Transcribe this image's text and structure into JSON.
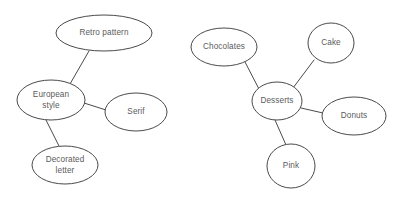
{
  "diagram": {
    "type": "node-link-graph",
    "background_color": "#ffffff",
    "stroke_color": "#4a4a4a",
    "text_color": "#5b5b5b",
    "clusters": [
      {
        "id": "european-style-cluster",
        "root": "European style",
        "nodes": [
          {
            "id": "retro-pattern",
            "label": "Retro pattern",
            "lines": [
              "Retro pattern"
            ],
            "cx": 104,
            "cy": 33,
            "rx": 48,
            "ry": 18
          },
          {
            "id": "european-style",
            "label": "European style",
            "lines": [
              "European",
              "style"
            ],
            "cx": 51,
            "cy": 100,
            "rx": 34,
            "ry": 20
          },
          {
            "id": "serif",
            "label": "Serif",
            "lines": [
              "Serif"
            ],
            "cx": 136,
            "cy": 112,
            "rx": 31,
            "ry": 19
          },
          {
            "id": "decorated-letter",
            "label": "Decorated letter",
            "lines": [
              "Decorated",
              "letter"
            ],
            "cx": 65,
            "cy": 165,
            "rx": 33,
            "ry": 19
          }
        ],
        "edges": [
          {
            "id": "edge-european-retro",
            "from": "european-style",
            "to": "retro-pattern",
            "x1": 70,
            "y1": 84,
            "x2": 89,
            "y2": 51
          },
          {
            "id": "edge-european-serif",
            "from": "european-style",
            "to": "serif",
            "x1": 84,
            "y1": 103,
            "x2": 106,
            "y2": 110
          },
          {
            "id": "edge-european-decorated",
            "from": "european-style",
            "to": "decorated-letter",
            "x1": 46,
            "y1": 120,
            "x2": 59,
            "y2": 146
          }
        ]
      },
      {
        "id": "desserts-cluster",
        "root": "Desserts",
        "nodes": [
          {
            "id": "chocolates",
            "label": "Chocolates",
            "lines": [
              "Chocolates"
            ],
            "cx": 224,
            "cy": 47,
            "rx": 33,
            "ry": 19
          },
          {
            "id": "cake",
            "label": "Cake",
            "lines": [
              "Cake"
            ],
            "cx": 331,
            "cy": 43,
            "rx": 23,
            "ry": 20
          },
          {
            "id": "desserts",
            "label": "Desserts",
            "lines": [
              "Desserts"
            ],
            "cx": 277,
            "cy": 101,
            "rx": 25,
            "ry": 19
          },
          {
            "id": "donuts",
            "label": "Donuts",
            "lines": [
              "Donuts"
            ],
            "cx": 354,
            "cy": 116,
            "rx": 32,
            "ry": 19
          },
          {
            "id": "pink",
            "label": "Pink",
            "lines": [
              "Pink"
            ],
            "cx": 291,
            "cy": 166,
            "rx": 24,
            "ry": 22
          }
        ],
        "edges": [
          {
            "id": "edge-desserts-chocolates",
            "from": "desserts",
            "to": "chocolates",
            "x1": 259,
            "y1": 89,
            "x2": 245,
            "y2": 62
          },
          {
            "id": "edge-desserts-cake",
            "from": "desserts",
            "to": "cake",
            "x1": 293,
            "y1": 88,
            "x2": 314,
            "y2": 60
          },
          {
            "id": "edge-desserts-donuts",
            "from": "desserts",
            "to": "donuts",
            "x1": 301,
            "y1": 108,
            "x2": 323,
            "y2": 113
          },
          {
            "id": "edge-desserts-pink",
            "from": "desserts",
            "to": "pink",
            "x1": 275,
            "y1": 120,
            "x2": 286,
            "y2": 145
          }
        ]
      }
    ]
  }
}
